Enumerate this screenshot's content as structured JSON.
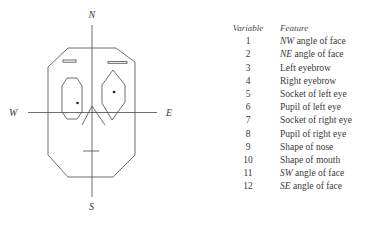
{
  "diagram": {
    "compass": {
      "north": "N",
      "south": "S",
      "west": "W",
      "east": "E"
    },
    "colors": {
      "stroke": "#4a4a4a",
      "text": "#3a3a3a",
      "background": "#ffffff"
    }
  },
  "legend": {
    "headers": {
      "variable": "Variable",
      "feature": "Feature"
    },
    "rows": [
      {
        "variable": "1",
        "prefix": "NW",
        "feature": " angle of face"
      },
      {
        "variable": "2",
        "prefix": "NE",
        "feature": " angle of face"
      },
      {
        "variable": "3",
        "prefix": "",
        "feature": "Left eyebrow"
      },
      {
        "variable": "4",
        "prefix": "",
        "feature": "Right eyebrow"
      },
      {
        "variable": "5",
        "prefix": "",
        "feature": "Socket of left eye"
      },
      {
        "variable": "6",
        "prefix": "",
        "feature": "Pupil of left eye"
      },
      {
        "variable": "7",
        "prefix": "",
        "feature": "Socket of right eye"
      },
      {
        "variable": "8",
        "prefix": "",
        "feature": "Pupil of right eye"
      },
      {
        "variable": "9",
        "prefix": "",
        "feature": "Shape of nose"
      },
      {
        "variable": "10",
        "prefix": "",
        "feature": "Shape of mouth"
      },
      {
        "variable": "11",
        "prefix": "SW",
        "feature": " angle of face"
      },
      {
        "variable": "12",
        "prefix": "SE",
        "feature": " angle of face"
      }
    ]
  }
}
